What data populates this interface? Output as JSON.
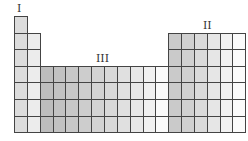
{
  "diagram": {
    "labels": [
      {
        "id": "I",
        "text": "I",
        "x": 17,
        "y": 3
      },
      {
        "id": "II",
        "text": "II",
        "x": 203,
        "y": 20
      },
      {
        "id": "III",
        "text": "III",
        "x": 96,
        "y": 53
      }
    ],
    "grid": {
      "left": 14,
      "top": 16,
      "col_width": 12.85,
      "row_height": 16.6,
      "columns": 18,
      "rows": 7
    },
    "column_shades": [
      "#dcdcdc",
      "#ececec",
      "#bdbdbd",
      "#c2c2c2",
      "#c8c8c8",
      "#cdcdcd",
      "#d3d3d3",
      "#d9d9d9",
      "#e0e0e0",
      "#e8e8e8",
      "#f1f1f1",
      "#fafafa",
      "#cacaca",
      "#d0d0d0",
      "#dadada",
      "#e6e6e6",
      "#f2f2f2",
      "#fbfbfb"
    ],
    "column_start_row": [
      0,
      1,
      3,
      3,
      3,
      3,
      3,
      3,
      3,
      3,
      3,
      3,
      1,
      1,
      1,
      1,
      1,
      1
    ]
  }
}
